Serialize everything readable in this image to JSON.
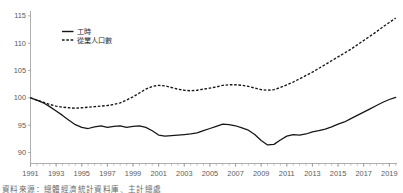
{
  "chart_data": {
    "type": "line",
    "title": "",
    "subtitle": "",
    "xlabel": "",
    "ylabel": "",
    "xlim": [
      1991,
      2019.6
    ],
    "ylim": [
      88,
      115.8
    ],
    "yticks": [
      90,
      95,
      100,
      105,
      110,
      115
    ],
    "xticks": [
      1991,
      1993,
      1995,
      1997,
      1999,
      2001,
      2003,
      2005,
      2007,
      2009,
      2011,
      2013,
      2015,
      2017,
      2019
    ],
    "x_minor_tick_interval": 0.5,
    "grid": false,
    "legend_position": "top-left-inside",
    "x": [
      1991,
      1991.5,
      1992,
      1992.5,
      1993,
      1993.5,
      1994,
      1994.5,
      1995,
      1995.5,
      1996,
      1996.5,
      1997,
      1997.5,
      1998,
      1998.5,
      1999,
      1999.5,
      2000,
      2000.5,
      2001,
      2001.5,
      2002,
      2002.5,
      2003,
      2003.5,
      2004,
      2004.5,
      2005,
      2005.5,
      2006,
      2006.5,
      2007,
      2007.5,
      2008,
      2008.5,
      2009,
      2009.5,
      2010,
      2010.5,
      2011,
      2011.5,
      2012,
      2012.5,
      2013,
      2013.5,
      2014,
      2014.5,
      2015,
      2015.5,
      2016,
      2016.5,
      2017,
      2017.5,
      2018,
      2018.5,
      2019,
      2019.5
    ],
    "series": [
      {
        "name": "工時",
        "style": "solid",
        "color": "#161616",
        "values": [
          100.0,
          99.6,
          99.1,
          98.4,
          97.6,
          96.8,
          95.9,
          95.1,
          94.6,
          94.4,
          94.7,
          94.9,
          94.6,
          94.8,
          94.9,
          94.6,
          94.8,
          94.9,
          94.6,
          94.0,
          93.2,
          93.0,
          93.1,
          93.2,
          93.3,
          93.4,
          93.6,
          94.0,
          94.4,
          94.8,
          95.2,
          95.1,
          94.9,
          94.5,
          94.1,
          93.3,
          92.2,
          91.4,
          91.5,
          92.3,
          93.0,
          93.3,
          93.2,
          93.4,
          93.8,
          94.0,
          94.3,
          94.7,
          95.2,
          95.6,
          96.2,
          96.8,
          97.4,
          98.0,
          98.6,
          99.2,
          99.7,
          100.1
        ]
      },
      {
        "name": "從業人口數",
        "style": "dashed",
        "color": "#161616",
        "values": [
          100.0,
          99.6,
          99.2,
          98.8,
          98.5,
          98.3,
          98.2,
          98.1,
          98.2,
          98.3,
          98.4,
          98.5,
          98.6,
          98.8,
          99.1,
          99.6,
          100.2,
          100.9,
          101.6,
          102.1,
          102.3,
          102.2,
          101.9,
          101.6,
          101.4,
          101.3,
          101.4,
          101.6,
          101.8,
          102.0,
          102.3,
          102.4,
          102.4,
          102.3,
          102.1,
          101.8,
          101.5,
          101.4,
          101.5,
          101.9,
          102.4,
          102.9,
          103.5,
          104.1,
          104.7,
          105.4,
          106.1,
          106.8,
          107.5,
          108.2,
          108.9,
          109.7,
          110.5,
          111.3,
          112.1,
          113.0,
          113.8,
          114.6
        ]
      }
    ]
  },
  "legend": {
    "items": [
      {
        "label": "工時",
        "style": "solid"
      },
      {
        "label": "從業人口數",
        "style": "dashed"
      }
    ]
  },
  "axis": {
    "y_tick_labels": [
      "115",
      "110",
      "105",
      "100",
      "95",
      "90"
    ],
    "x_tick_labels": [
      "1991",
      "1993",
      "1995",
      "1997",
      "1999",
      "2001",
      "2003",
      "2005",
      "2007",
      "2009",
      "2011",
      "2013",
      "2015",
      "2017",
      "2019"
    ]
  },
  "caption": {
    "text": "資料來源：總體經濟統計資料庫、主計總處"
  }
}
